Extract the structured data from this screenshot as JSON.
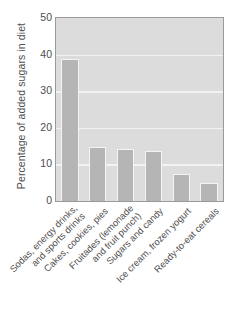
{
  "chart_data": {
    "type": "bar",
    "title": "",
    "subtitle": "",
    "xlabel": "",
    "ylabel": "Percentage of added sugars in diet",
    "ylim": [
      0,
      50
    ],
    "yticks": [
      50,
      40,
      30,
      20,
      10,
      0
    ],
    "ytick_labels": [
      "50",
      "40",
      "30",
      "20",
      "10",
      "0"
    ],
    "grid": true,
    "grid_axis": "y",
    "legend": false,
    "legend_position": "none",
    "orientation": "vertical",
    "categories": [
      "Sodas, energy drinks,\nand sports drinks",
      "Cakes, cookies, pies",
      "Fruitades (lemonade\nand fruit punch)",
      "Sugars and candy",
      "Ice cream, frozen yogurt",
      "Ready-to-eat cereals"
    ],
    "category_lines": [
      [
        "Sodas, energy drinks,",
        "and sports drinks"
      ],
      [
        "Cakes, cookies, pies"
      ],
      [
        "Fruitades (lemonade",
        "and fruit punch)"
      ],
      [
        "Sugars and candy"
      ],
      [
        "Ice cream, frozen yogurt"
      ],
      [
        "Ready-to-eat cereals"
      ]
    ],
    "values": [
      38.8,
      14.8,
      14.3,
      13.8,
      7.4,
      5.0
    ],
    "bar_color": "#b5b5b5",
    "bar_edge_color": "#f4f4f4",
    "plot_background": "#dcdcdc",
    "gridline_color": "#f2f2f2",
    "axis_color": "#9a9a9a",
    "text_color": "#4d4d4d",
    "page_background": "#ffffff"
  }
}
